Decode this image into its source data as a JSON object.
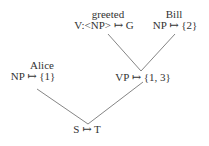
{
  "diagram": {
    "type": "semantic-parse-tree",
    "nodes": [
      {
        "id": "greeted",
        "word": "greeted",
        "label": "V:<NP> ↦ G"
      },
      {
        "id": "bill",
        "word": "Bill",
        "label": "NP ↦ {2}"
      },
      {
        "id": "alice",
        "word": "Alice",
        "label": "NP ↦ {1}"
      },
      {
        "id": "vp",
        "word": "",
        "label": "VP ↦ {1, 3}"
      },
      {
        "id": "s",
        "word": "",
        "label": "S ↦ T"
      }
    ],
    "edges": [
      {
        "from": "greeted",
        "to": "vp"
      },
      {
        "from": "bill",
        "to": "vp"
      },
      {
        "from": "alice",
        "to": "s"
      },
      {
        "from": "vp",
        "to": "s"
      }
    ],
    "colors": {
      "text": "#333333",
      "edge": "#777777",
      "background": "#ffffff"
    }
  }
}
